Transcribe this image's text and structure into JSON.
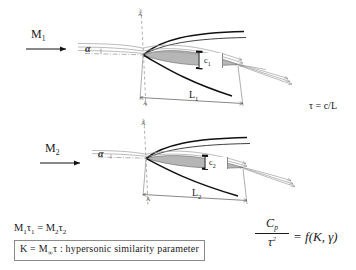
{
  "figure": {
    "title_present": false,
    "background": "#ffffff",
    "ink": "#1a1a1a",
    "body_fill": "#b6b6b6",
    "shock_color": "#111111",
    "streamline_color": "#9a9a9a"
  },
  "labels": {
    "mach_1": "M",
    "mach_1_sub": "1",
    "mach_2": "M",
    "mach_2_sub": "2",
    "alpha_1": "α",
    "alpha_2": "α",
    "length_1": "L",
    "length_1_sub": "1",
    "length_2": "L",
    "length_2_sub": "2",
    "thickness_1": "c",
    "thickness_1_sub": "1",
    "thickness_2": "c",
    "thickness_2_sub": "2",
    "axis_top_1": "A",
    "axis_bottom_1": "A",
    "axis_top_2": "A",
    "axis_bottom_2": "A",
    "tau_def": "τ = c/L"
  },
  "equations": {
    "similarity_relation_parts": {
      "m1": "M",
      "m1_sub": "1",
      "t1": "τ",
      "t1_sub": "1",
      "eq": " = ",
      "m2": "M",
      "m2_sub": "2",
      "t2": "τ",
      "t2_sub": "2"
    },
    "similarity_relation_text": "M₁τ₁ = M₂τ₂",
    "k_definition": {
      "lhs": "K = M",
      "lhs_sub": "∞",
      "lhs_tail": "τ",
      "colon": " : ",
      "description": "hypersonic similarity parameter"
    },
    "k_definition_text": "K = M∞τ : hypersonic similarity parameter",
    "cp_relation": {
      "numerator": "C",
      "numerator_sub": "p",
      "denominator": "τ",
      "denominator_sup": "2",
      "rhs": "= f(K, γ)"
    },
    "cp_relation_text": "Cp / τ² = f(K, γ)"
  },
  "diagrams": [
    {
      "name": "upper-configuration",
      "mach_label": "M1",
      "chord_label": "L1",
      "thickness_label": "c1",
      "relative_thickness": "thicker",
      "angle_of_attack_label": "α"
    },
    {
      "name": "lower-configuration",
      "mach_label": "M2",
      "chord_label": "L2",
      "thickness_label": "c2",
      "relative_thickness": "thinner",
      "angle_of_attack_label": "α"
    }
  ]
}
